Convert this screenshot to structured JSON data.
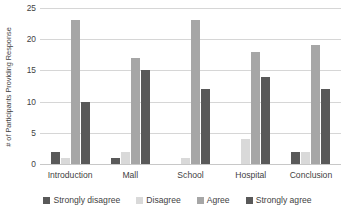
{
  "chart_data": {
    "type": "bar",
    "title": "",
    "xlabel": "",
    "ylabel": "# of Participants Providing Response",
    "categories": [
      "Introduction",
      "Mall",
      "School",
      "Hospital",
      "Conclusion"
    ],
    "series": [
      {
        "name": "Strongly disagree",
        "color": "#595959",
        "values": [
          2,
          1,
          0,
          0,
          2
        ]
      },
      {
        "name": "Disagree",
        "color": "#d9d9d9",
        "values": [
          1,
          2,
          1,
          4,
          2
        ]
      },
      {
        "name": "Agree",
        "color": "#a6a6a6",
        "values": [
          23,
          17,
          23,
          18,
          19
        ]
      },
      {
        "name": "Strongly agree",
        "color": "#595959",
        "values": [
          10,
          15,
          12,
          14,
          12
        ]
      }
    ],
    "ylim": [
      0,
      25
    ],
    "yticks": [
      0,
      5,
      10,
      15,
      20,
      25
    ],
    "ytick_labels": [
      "0",
      "5",
      "10",
      "15",
      "20",
      "25"
    ],
    "grid": "horizontal",
    "legend_position": "bottom",
    "legend_entries": [
      "Strongly disagree",
      "Disagree",
      "Agree",
      "Strongly agree"
    ],
    "axis_line_color": "#c8c8c8",
    "gridline_color": "#d6d6d6",
    "text_color": "#3f3f3f",
    "background": "#ffffff"
  }
}
